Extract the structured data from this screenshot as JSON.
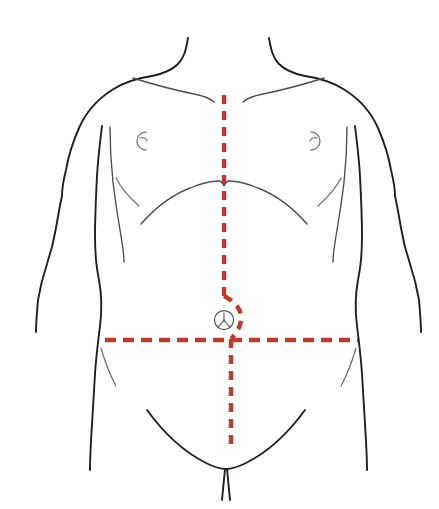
{
  "page": {
    "background_color": "#ffffff",
    "width": 439,
    "height": 509,
    "top_cropped_text": "—  —  —   — — — — ——"
  },
  "figure": {
    "outline_color": "#231f20",
    "detail_color": "#4d4d4d",
    "accent_color": "#C0392B",
    "umbilicus_color": "#5a5a66",
    "parts": [
      {
        "id": "neck-left",
        "label": "Left neck line"
      },
      {
        "id": "neck-right",
        "label": "Right neck line"
      },
      {
        "id": "shoulder-left",
        "label": "Left shoulder and arm"
      },
      {
        "id": "shoulder-right",
        "label": "Right shoulder and arm"
      },
      {
        "id": "clavicle-left",
        "label": "Left clavicle"
      },
      {
        "id": "clavicle-right",
        "label": "Right clavicle"
      },
      {
        "id": "pectoral-left",
        "label": "Left pectoral border"
      },
      {
        "id": "pectoral-right",
        "label": "Right pectoral border"
      },
      {
        "id": "nipple-left",
        "label": "Left nipple"
      },
      {
        "id": "nipple-right",
        "label": "Right nipple"
      },
      {
        "id": "costal-margin",
        "label": "Costal margin (rib arch)"
      },
      {
        "id": "flank-left",
        "label": "Left flank crease"
      },
      {
        "id": "flank-right",
        "label": "Right flank crease"
      },
      {
        "id": "inguinal-curve",
        "label": "Inguinal / pubic curve"
      },
      {
        "id": "pubic-cleft",
        "label": "Pubic cleft"
      },
      {
        "id": "umbilicus",
        "label": "Umbilicus (navel)"
      }
    ]
  },
  "incisions": {
    "color": "#C0392B",
    "stroke_width": 4.4,
    "lines": [
      {
        "id": "midline-vertical",
        "name": "Vertical midline incision",
        "orientation": "vertical",
        "style": "dashed",
        "dash": "9 7",
        "start": [
          224,
          95
        ],
        "end": [
          231,
          445
        ],
        "detours_around": "umbilicus"
      },
      {
        "id": "transverse-horizontal",
        "name": "Transverse incision",
        "orientation": "horizontal",
        "style": "dashed",
        "dash": "11 7",
        "start": [
          105,
          340
        ],
        "end": [
          358,
          340
        ]
      }
    ]
  },
  "umbilicus": {
    "name": "umbilicus",
    "center": [
      224,
      320
    ],
    "radius": 9.5
  }
}
